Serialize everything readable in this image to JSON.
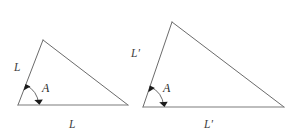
{
  "figure": {
    "background_color": "#ffffff",
    "line_color": "#6b6b6b",
    "base_line_color": "#7d7d7d",
    "label_color": "#3d3d3d",
    "arrow_color": "#1b1b1b",
    "width": 302,
    "height": 136
  },
  "triangles": [
    {
      "id": "small-triangle",
      "name": "left-triangle",
      "vertices": {
        "left": [
          18,
          105
        ],
        "apex": [
          43,
          40
        ],
        "right": [
          128,
          105
        ]
      },
      "labels": {
        "left_side": "L",
        "base_side": "L",
        "angle": "A"
      },
      "label_positions": {
        "left_side": [
          14,
          71
        ],
        "base_side": [
          69,
          128
        ],
        "angle": [
          42,
          92
        ]
      },
      "angle_arc": {
        "center": [
          18,
          105
        ],
        "radius": 21,
        "start_deg": 291,
        "end_deg": 0,
        "arrowheads": 2
      }
    },
    {
      "id": "large-triangle",
      "name": "right-triangle",
      "vertices": {
        "left": [
          143,
          107
        ],
        "apex": [
          172,
          22
        ],
        "right": [
          284,
          107
        ]
      },
      "labels": {
        "left_side": "L′",
        "base_side": "L′",
        "angle": "A"
      },
      "label_positions": {
        "left_side": [
          131,
          57
        ],
        "base_side": [
          204,
          128
        ],
        "angle": [
          163,
          92
        ]
      },
      "angle_arc": {
        "center": [
          143,
          107
        ],
        "radius": 21,
        "start_deg": 289,
        "end_deg": 0,
        "arrowheads": 2
      }
    }
  ],
  "annotations": {
    "side_label_small_vertical": "L",
    "side_label_small_base": "L",
    "angle_label_small": "A",
    "side_label_large_vertical": "L′",
    "side_label_large_base": "L′",
    "angle_label_large": "A"
  }
}
